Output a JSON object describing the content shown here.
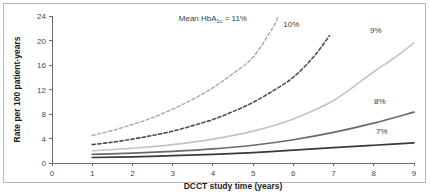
{
  "chart_data": {
    "type": "line",
    "title": "",
    "xlabel": "DCCT study time (years)",
    "ylabel": "Rate per 100 patient-years",
    "xlim": [
      0,
      9
    ],
    "ylim": [
      0,
      24
    ],
    "xticks": [
      "0",
      "1",
      "2",
      "3",
      "4",
      "5",
      "6",
      "7",
      "8",
      "9"
    ],
    "yticks": [
      "0",
      "4",
      "8",
      "12",
      "16",
      "20",
      "24"
    ],
    "grid": false,
    "legend_position": "inline-right-of-curve",
    "annotations": [
      {
        "name": "mean-hba1c-annotation",
        "text_prefix": "Mean HbA",
        "text_sub": "1c",
        "text_suffix": " = 11%",
        "x": 4.0,
        "y": 23.2
      }
    ],
    "series": [
      {
        "name": "11%",
        "label": "Mean HbA1c = 11%",
        "style": "dashed",
        "color": "#a8a8a8",
        "width": 1.4,
        "x": [
          1,
          1.5,
          2,
          2.5,
          3,
          3.5,
          4,
          4.5,
          5,
          5.5,
          5.62
        ],
        "values": [
          4.5,
          5.3,
          6.3,
          7.4,
          8.8,
          10.4,
          12.3,
          14.6,
          17.3,
          22.2,
          24.0
        ]
      },
      {
        "name": "10%",
        "label": "10%",
        "style": "dashed",
        "color": "#4f4f4f",
        "width": 1.6,
        "x": [
          1,
          1.5,
          2,
          2.5,
          3,
          3.5,
          4,
          4.5,
          5,
          5.5,
          6,
          6.5,
          6.9
        ],
        "values": [
          3.0,
          3.4,
          3.9,
          4.5,
          5.2,
          6.1,
          7.1,
          8.4,
          9.9,
          11.8,
          14.0,
          17.3,
          20.8
        ]
      },
      {
        "name": "9%",
        "label": "9%",
        "style": "solid",
        "color": "#c4c4c4",
        "width": 1.6,
        "x": [
          1,
          2,
          3,
          4,
          5,
          6,
          7,
          8,
          8.5,
          9
        ],
        "values": [
          2.0,
          2.4,
          3.0,
          3.9,
          5.2,
          7.2,
          10.2,
          14.9,
          17.1,
          19.6
        ]
      },
      {
        "name": "8%",
        "label": "8%",
        "style": "solid",
        "color": "#6a6a6a",
        "width": 1.7,
        "x": [
          1,
          2,
          3,
          4,
          5,
          6,
          7,
          8,
          9
        ],
        "values": [
          1.4,
          1.6,
          1.9,
          2.3,
          2.9,
          3.8,
          5.0,
          6.5,
          8.3
        ]
      },
      {
        "name": "7%",
        "label": "7%",
        "style": "solid",
        "color": "#3a3a3a",
        "width": 1.7,
        "x": [
          1,
          2,
          3,
          4,
          5,
          6,
          7,
          8,
          9
        ],
        "values": [
          0.9,
          1.0,
          1.2,
          1.4,
          1.7,
          2.1,
          2.5,
          2.9,
          3.3
        ]
      }
    ],
    "series_label_positions": [
      {
        "name": "10%",
        "x": 5.95,
        "y": 22.2
      },
      {
        "name": "9%",
        "x": 8.05,
        "y": 21.2
      },
      {
        "name": "8%",
        "x": 8.15,
        "y": 9.6
      },
      {
        "name": "7%",
        "x": 8.2,
        "y": 4.7
      }
    ]
  }
}
